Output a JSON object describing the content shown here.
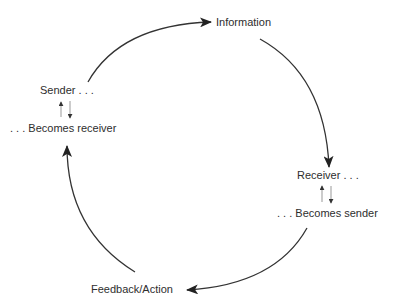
{
  "diagram": {
    "type": "cycle",
    "nodes": {
      "information": {
        "label": "Information"
      },
      "receiver": {
        "label": "Receiver . . ."
      },
      "becomes_sender": {
        "label": ". . . Becomes sender"
      },
      "feedback": {
        "label": "Feedback/Action"
      },
      "sender": {
        "label": "Sender . . ."
      },
      "becomes_receiver": {
        "label": ". . . Becomes receiver"
      }
    },
    "edges": [
      {
        "from": "Sender",
        "to": "Information",
        "style": "curved-arrow"
      },
      {
        "from": "Information",
        "to": "Receiver",
        "style": "curved-arrow"
      },
      {
        "from": "Becomes sender",
        "to": "Feedback/Action",
        "style": "curved-arrow"
      },
      {
        "from": "Feedback/Action",
        "to": "Becomes receiver",
        "style": "curved-arrow"
      },
      {
        "from": "Sender",
        "to": "Becomes receiver",
        "style": "bidirectional-small"
      },
      {
        "from": "Receiver",
        "to": "Becomes sender",
        "style": "bidirectional-small"
      }
    ],
    "colors": {
      "stroke": "#333333",
      "text": "#2e2e2e",
      "small_arrow": "#888888",
      "background": "#ffffff"
    }
  }
}
